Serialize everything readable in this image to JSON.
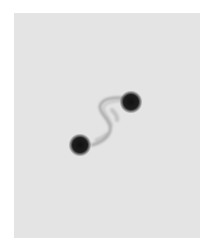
{
  "image": {
    "description": "Grayscale micrograph of two dark spherical blobs joined by a thin S-shaped filament",
    "background_color": "#ffffff",
    "panel_color": "#e4e4e4",
    "blob_color": "#1a1a1a",
    "filament_color": "#8a8a8a",
    "blobs": [
      {
        "label": "upper-right",
        "cx": 131,
        "cy": 102,
        "r": 10
      },
      {
        "label": "lower-left",
        "cx": 80,
        "cy": 145,
        "r": 10
      }
    ]
  }
}
